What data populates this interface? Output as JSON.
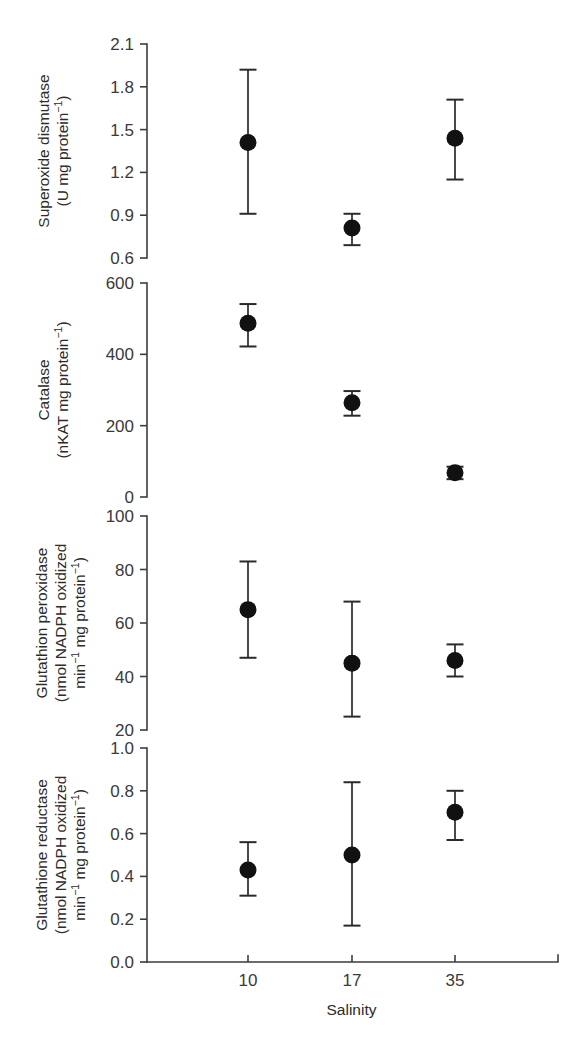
{
  "figure": {
    "x_axis": {
      "label": "Salinity",
      "tick_labels": [
        "10",
        "17",
        "35"
      ],
      "values": [
        10,
        17,
        35
      ]
    },
    "panels": [
      {
        "id": "superoxide-dismutase",
        "title_line1": "Superoxide dismutase",
        "title_line2_pre": "(U mg protein",
        "title_line2_sup": "−1",
        "title_line2_post": ")",
        "ticks": [
          "2.1",
          "1.8",
          "1.5",
          "1.2",
          "0.9",
          "0.6"
        ],
        "tick_values": [
          2.1,
          1.8,
          1.5,
          1.2,
          0.9,
          0.6
        ],
        "ylim": [
          0.6,
          2.1
        ]
      },
      {
        "id": "catalase",
        "title_line1": "Catalase",
        "title_line2_pre": "(nKAT mg protein",
        "title_line2_sup": "−1",
        "title_line2_post": ")",
        "ticks": [
          "600",
          "400",
          "200",
          "0"
        ],
        "tick_values": [
          600,
          400,
          200,
          0
        ],
        "ylim": [
          0,
          600
        ]
      },
      {
        "id": "glutathion-peroxidase",
        "title_line1": "Glutathion peroxidase",
        "title_line2_pre": "(nmol NADPH oxidized",
        "title_line2_sup": "",
        "title_line2_post": "",
        "title_line3_pre": "min",
        "title_line3_sup1": "−1",
        "title_line3_mid": " mg protein",
        "title_line3_sup2": "−1",
        "title_line3_post": ")",
        "ticks": [
          "100",
          "80",
          "60",
          "40",
          "20"
        ],
        "tick_values": [
          100,
          80,
          60,
          40,
          20
        ],
        "ylim": [
          20,
          100
        ]
      },
      {
        "id": "glutathione-reductase",
        "title_line1": "Glutathione reductase",
        "title_line2_pre": "(nmol NADPH oxidized",
        "title_line2_sup": "",
        "title_line2_post": "",
        "title_line3_pre": "min",
        "title_line3_sup1": "−1",
        "title_line3_mid": " mg protein",
        "title_line3_sup2": "−1",
        "title_line3_post": ")",
        "ticks": [
          "1.0",
          "0.8",
          "0.6",
          "0.4",
          "0.2",
          "0.0"
        ],
        "tick_values": [
          1.0,
          0.8,
          0.6,
          0.4,
          0.2,
          0.0
        ],
        "ylim": [
          0.0,
          1.0
        ]
      }
    ]
  },
  "chart_data": [
    {
      "type": "scatter",
      "title": "Superoxide dismutase (U mg protein−1)",
      "xlabel": "Salinity",
      "ylabel": "Superoxide dismutase (U mg protein−1)",
      "x": [
        10,
        17,
        35
      ],
      "xtick_labels": [
        "10",
        "17",
        "35"
      ],
      "values": [
        1.41,
        0.81,
        1.44
      ],
      "err_upper": [
        1.92,
        0.91,
        1.71
      ],
      "err_lower": [
        0.91,
        0.69,
        1.15
      ],
      "ylim": [
        0.6,
        2.1
      ],
      "yticks": [
        0.6,
        0.9,
        1.2,
        1.5,
        1.8,
        2.1
      ],
      "grid": false,
      "legend": null
    },
    {
      "type": "scatter",
      "title": "Catalase (nKAT mg protein−1)",
      "xlabel": "Salinity",
      "ylabel": "Catalase (nKAT mg protein−1)",
      "x": [
        10,
        17,
        35
      ],
      "xtick_labels": [
        "10",
        "17",
        "35"
      ],
      "values": [
        487,
        264,
        68
      ],
      "err_upper": [
        541,
        297,
        85
      ],
      "err_lower": [
        422,
        228,
        50
      ],
      "ylim": [
        0,
        600
      ],
      "yticks": [
        0,
        200,
        400,
        600
      ],
      "grid": false,
      "legend": null
    },
    {
      "type": "scatter",
      "title": "Glutathion peroxidase (nmol NADPH oxidized min−1 mg protein−1)",
      "xlabel": "Salinity",
      "ylabel": "Glutathion peroxidase (nmol NADPH oxidized min−1 mg protein−1)",
      "x": [
        10,
        17,
        35
      ],
      "xtick_labels": [
        "10",
        "17",
        "35"
      ],
      "values": [
        65,
        45,
        46
      ],
      "err_upper": [
        83,
        68,
        52
      ],
      "err_lower": [
        47,
        25,
        40
      ],
      "ylim": [
        20,
        100
      ],
      "yticks": [
        20,
        40,
        60,
        80,
        100
      ],
      "grid": false,
      "legend": null
    },
    {
      "type": "scatter",
      "title": "Glutathione reductase (nmol NADPH oxidized min−1 mg protein−1)",
      "xlabel": "Salinity",
      "ylabel": "Glutathione reductase (nmol NADPH oxidized min−1 mg protein−1)",
      "x": [
        10,
        17,
        35
      ],
      "xtick_labels": [
        "10",
        "17",
        "35"
      ],
      "values": [
        0.43,
        0.5,
        0.7
      ],
      "err_upper": [
        0.56,
        0.84,
        0.8
      ],
      "err_lower": [
        0.31,
        0.17,
        0.57
      ],
      "ylim": [
        0.0,
        1.0
      ],
      "yticks": [
        0.0,
        0.2,
        0.4,
        0.6,
        0.8,
        1.0
      ],
      "grid": false,
      "legend": null
    }
  ]
}
